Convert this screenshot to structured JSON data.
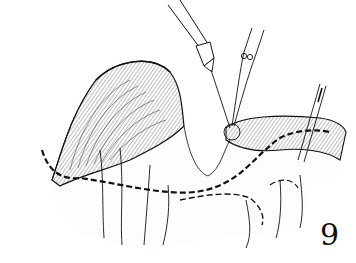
{
  "figure": {
    "number": "9",
    "colors": {
      "ink": "#111111",
      "stipple": "#9a9a9a",
      "background": "#ffffff"
    },
    "elements": [
      "tissue-fold-left",
      "tissue-flap-right",
      "dashed-incision-line",
      "syringe-needle",
      "forceps",
      "scalpel"
    ]
  }
}
